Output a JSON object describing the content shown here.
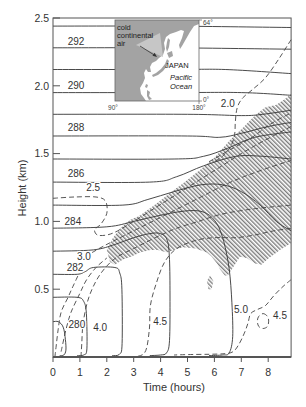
{
  "figure": {
    "xlabel": "Time (hours)",
    "ylabel": "Height (km)"
  },
  "inset": {
    "labels": {
      "cold_air": [
        "cold",
        "continental",
        "air"
      ],
      "country": "JAPAN",
      "ocean": [
        "Pacific",
        "Ocean"
      ]
    },
    "corners": {
      "lon_left": "90°",
      "lon_right": "180°",
      "lat_top": "64°",
      "lat_bottom": "0°"
    },
    "colors": {
      "land": "#a3a3a3",
      "land_light": "#c6c6c6",
      "ocean": "#ffffff"
    }
  },
  "chart_data": {
    "type": "line",
    "title": "",
    "xlabel": "Time (hours)",
    "ylabel": "Height (km)",
    "xlim": [
      0,
      8.85
    ],
    "ylim": [
      0,
      2.5
    ],
    "grid": false,
    "legend": null,
    "xticks": [
      {
        "value": 0,
        "label": "0"
      },
      {
        "value": 1,
        "label": "1"
      },
      {
        "value": 2,
        "label": "2"
      },
      {
        "value": 3,
        "label": "3"
      },
      {
        "value": 4,
        "label": "4"
      },
      {
        "value": 5,
        "label": "5"
      },
      {
        "value": 6,
        "label": "6"
      },
      {
        "value": 7,
        "label": "7"
      },
      {
        "value": 8,
        "label": "8"
      }
    ],
    "yticks": [
      {
        "value": 0.5,
        "label": "0.5"
      },
      {
        "value": 1.0,
        "label": "1.0"
      },
      {
        "value": 1.5,
        "label": "1.5"
      },
      {
        "value": 2.0,
        "label": "2.0"
      },
      {
        "value": 2.5,
        "label": "2.5"
      }
    ],
    "colors": {
      "solid": "#363636",
      "dashed": "#444444",
      "hatch": "#5a5a5a",
      "frame": "#555555"
    },
    "solid_contours": [
      {
        "points": [
          [
            0,
            2.44
          ],
          [
            4.4,
            2.44
          ],
          [
            8.85,
            2.43
          ]
        ]
      },
      {
        "points": [
          [
            0,
            2.28
          ],
          [
            4.4,
            2.28
          ],
          [
            8.85,
            2.27
          ]
        ]
      },
      {
        "points": [
          [
            0,
            2.12
          ],
          [
            4.4,
            2.12
          ],
          [
            6.4,
            2.12
          ],
          [
            8.85,
            2.09
          ]
        ]
      },
      {
        "points": [
          [
            0,
            1.95
          ],
          [
            4.4,
            1.95
          ],
          [
            7.0,
            1.95
          ],
          [
            8.85,
            1.93
          ]
        ]
      },
      {
        "points": [
          [
            0,
            1.79
          ],
          [
            5.0,
            1.79
          ],
          [
            7.0,
            1.78
          ],
          [
            7.8,
            1.79
          ],
          [
            8.85,
            1.82
          ]
        ]
      },
      {
        "points": [
          [
            0,
            1.63
          ],
          [
            5.0,
            1.63
          ],
          [
            6.2,
            1.62
          ],
          [
            7.0,
            1.65
          ],
          [
            8.0,
            1.7
          ],
          [
            8.85,
            1.73
          ]
        ]
      },
      {
        "points": [
          [
            0,
            1.46
          ],
          [
            4.5,
            1.46
          ],
          [
            5.6,
            1.48
          ],
          [
            6.5,
            1.54
          ],
          [
            7.5,
            1.62
          ],
          [
            8.85,
            1.66
          ]
        ]
      },
      {
        "points": [
          [
            0,
            1.29
          ],
          [
            3.6,
            1.29
          ],
          [
            4.6,
            1.33
          ],
          [
            5.6,
            1.41
          ],
          [
            6.8,
            1.48
          ],
          [
            7.8,
            1.48
          ],
          [
            8.85,
            1.46
          ]
        ]
      },
      {
        "points": [
          [
            0,
            1.12
          ],
          [
            2.6,
            1.12
          ],
          [
            3.5,
            1.16
          ],
          [
            4.5,
            1.22
          ],
          [
            5.5,
            1.27
          ],
          [
            6.3,
            1.27
          ],
          [
            7.0,
            1.22
          ],
          [
            7.7,
            1.12
          ],
          [
            8.3,
            1.0
          ],
          [
            8.85,
            0.93
          ]
        ]
      },
      {
        "points": [
          [
            0,
            0.95
          ],
          [
            2.0,
            0.96
          ],
          [
            3.0,
            1.0
          ],
          [
            4.1,
            1.05
          ],
          [
            5.1,
            1.08
          ],
          [
            5.7,
            1.06
          ],
          [
            6.1,
            0.98
          ],
          [
            6.35,
            0.85
          ],
          [
            6.55,
            0.65
          ],
          [
            6.65,
            0.4
          ],
          [
            6.68,
            0.15
          ],
          [
            6.55,
            0.03
          ],
          [
            6.3,
            0.015
          ],
          [
            5.8,
            0.01
          ]
        ]
      },
      {
        "points": [
          [
            0,
            0.78
          ],
          [
            1.5,
            0.79
          ],
          [
            2.3,
            0.83
          ],
          [
            3.0,
            0.88
          ],
          [
            3.6,
            0.91
          ],
          [
            4.0,
            0.91
          ],
          [
            4.25,
            0.86
          ],
          [
            4.33,
            0.72
          ],
          [
            4.35,
            0.45
          ],
          [
            4.33,
            0.12
          ],
          [
            4.22,
            0.03
          ],
          [
            4.0,
            0.015
          ],
          [
            3.6,
            0.01
          ]
        ]
      },
      {
        "points": [
          [
            0,
            0.61
          ],
          [
            0.9,
            0.61
          ],
          [
            1.2,
            0.63
          ],
          [
            1.5,
            0.66
          ],
          [
            2.3,
            0.66
          ],
          [
            2.48,
            0.62
          ],
          [
            2.56,
            0.5
          ],
          [
            2.57,
            0.1
          ],
          [
            2.47,
            0.02
          ],
          [
            2.2,
            0.01
          ]
        ]
      },
      {
        "points": [
          [
            0,
            0.44
          ],
          [
            0.9,
            0.44
          ],
          [
            1.14,
            0.41
          ],
          [
            1.24,
            0.32
          ],
          [
            1.26,
            0.06
          ],
          [
            1.14,
            0.015
          ],
          [
            0.9,
            0.01
          ]
        ]
      },
      {
        "points": [
          [
            0,
            0.26
          ],
          [
            0.2,
            0.26
          ],
          [
            0.38,
            0.22
          ],
          [
            0.46,
            0.13
          ],
          [
            0.48,
            0.05
          ],
          [
            0.4,
            0.015
          ],
          [
            0.25,
            0.01
          ]
        ]
      }
    ],
    "solid_labels": [
      {
        "text": "292",
        "t": 0.86,
        "h": 2.33
      },
      {
        "text": "290",
        "t": 0.86,
        "h": 2.0
      },
      {
        "text": "288",
        "t": 0.86,
        "h": 1.69
      },
      {
        "text": "286",
        "t": 0.86,
        "h": 1.35
      },
      {
        "text": "284",
        "t": 0.74,
        "h": 1.0
      },
      {
        "text": "282",
        "t": 0.82,
        "h": 0.66
      },
      {
        "text": "280",
        "t": 0.89,
        "h": 0.24
      }
    ],
    "dashed_contours": [
      {
        "closed": false,
        "points": [
          [
            8.85,
            2.34
          ],
          [
            8.4,
            2.2
          ],
          [
            7.9,
            2.06
          ],
          [
            7.4,
            1.97
          ],
          [
            7.05,
            1.91
          ],
          [
            6.85,
            1.84
          ],
          [
            6.78,
            1.74
          ],
          [
            6.75,
            1.64
          ],
          [
            6.6,
            1.55
          ],
          [
            6.3,
            1.48
          ],
          [
            6.0,
            1.44
          ]
        ]
      },
      {
        "closed": false,
        "points": [
          [
            0,
            1.17
          ],
          [
            0.8,
            1.18
          ],
          [
            1.6,
            1.18
          ],
          [
            1.95,
            1.15
          ],
          [
            2.0,
            1.06
          ],
          [
            1.78,
            0.98
          ],
          [
            1.55,
            0.94
          ],
          [
            1.65,
            0.9
          ],
          [
            2.0,
            0.9
          ],
          [
            2.4,
            0.93
          ],
          [
            3.0,
            1.0
          ],
          [
            3.8,
            1.1
          ],
          [
            4.6,
            1.2
          ],
          [
            5.4,
            1.3
          ],
          [
            6.2,
            1.4
          ],
          [
            7.0,
            1.5
          ],
          [
            7.8,
            1.59
          ],
          [
            8.85,
            1.7
          ]
        ]
      },
      {
        "closed": false,
        "points": [
          [
            0.07,
            0.0
          ],
          [
            0.11,
            0.07
          ],
          [
            0.19,
            0.2
          ],
          [
            0.3,
            0.33
          ],
          [
            0.56,
            0.44
          ],
          [
            0.74,
            0.52
          ],
          [
            0.93,
            0.6
          ]
        ]
      },
      {
        "closed": false,
        "points": [
          [
            1.45,
            0.77
          ],
          [
            1.9,
            0.82
          ],
          [
            2.6,
            0.89
          ],
          [
            3.5,
            0.98
          ],
          [
            4.5,
            1.08
          ],
          [
            5.5,
            1.18
          ],
          [
            6.5,
            1.28
          ],
          [
            7.5,
            1.36
          ],
          [
            8.85,
            1.45
          ]
        ]
      },
      {
        "closed": false,
        "points": [
          [
            0.3,
            0.04
          ],
          [
            0.48,
            0.2
          ],
          [
            0.67,
            0.33
          ],
          [
            1.0,
            0.47
          ],
          [
            1.25,
            0.57
          ],
          [
            1.6,
            0.66
          ],
          [
            2.0,
            0.73
          ]
        ]
      },
      {
        "closed": false,
        "points": [
          [
            1.04,
            0.0
          ],
          [
            1.07,
            0.1
          ],
          [
            1.12,
            0.25
          ],
          [
            1.3,
            0.42
          ],
          [
            1.6,
            0.56
          ],
          [
            1.95,
            0.66
          ],
          [
            2.4,
            0.74
          ],
          [
            3.0,
            0.8
          ],
          [
            3.8,
            0.88
          ],
          [
            4.6,
            0.95
          ],
          [
            5.4,
            1.0
          ],
          [
            6.2,
            1.05
          ],
          [
            7.0,
            1.08
          ],
          [
            7.8,
            1.1
          ],
          [
            8.85,
            1.12
          ]
        ]
      },
      {
        "closed": false,
        "points": [
          [
            2.86,
            0.0
          ],
          [
            3.4,
            0.03
          ],
          [
            3.58,
            0.2
          ],
          [
            3.62,
            0.38
          ],
          [
            3.85,
            0.55
          ],
          [
            4.15,
            0.7
          ],
          [
            4.6,
            0.8
          ],
          [
            5.3,
            0.86
          ],
          [
            6.0,
            0.88
          ],
          [
            6.8,
            0.88
          ],
          [
            7.5,
            0.9
          ],
          [
            8.2,
            0.93
          ],
          [
            8.85,
            0.95
          ]
        ]
      },
      {
        "closed": false,
        "points": [
          [
            8.85,
            0.57
          ],
          [
            8.55,
            0.52
          ],
          [
            8.2,
            0.45
          ],
          [
            7.9,
            0.38
          ],
          [
            7.6,
            0.35
          ],
          [
            7.35,
            0.32
          ],
          [
            7.25,
            0.25
          ],
          [
            7.1,
            0.17
          ],
          [
            6.9,
            0.09
          ],
          [
            6.7,
            0.04
          ],
          [
            6.4,
            0.025
          ],
          [
            5.8,
            0.02
          ],
          [
            5.0,
            0.018
          ],
          [
            4.5,
            0.015
          ]
        ]
      },
      {
        "closed": true,
        "points": [
          [
            7.81,
            0.32
          ],
          [
            7.97,
            0.3
          ],
          [
            8.02,
            0.265
          ],
          [
            7.97,
            0.225
          ],
          [
            7.81,
            0.21
          ],
          [
            7.65,
            0.225
          ],
          [
            7.6,
            0.265
          ],
          [
            7.65,
            0.3
          ]
        ]
      },
      {
        "closed": false,
        "points": [
          [
            5.8,
            1.44
          ],
          [
            6.6,
            1.53
          ],
          [
            7.4,
            1.62
          ],
          [
            8.1,
            1.72
          ],
          [
            8.85,
            1.8
          ]
        ]
      }
    ],
    "dashed_labels": [
      {
        "text": "2.0",
        "t": 6.5,
        "h": 1.87
      },
      {
        "text": "2.5",
        "t": 1.49,
        "h": 1.25
      },
      {
        "text": "3.0",
        "t": 1.15,
        "h": 0.74
      },
      {
        "text": "4.0",
        "t": 1.75,
        "h": 0.22
      },
      {
        "text": "4.5",
        "t": 3.98,
        "h": 0.26
      },
      {
        "text": "5.0",
        "t": 6.99,
        "h": 0.35
      },
      {
        "text": "4.5",
        "t": 8.44,
        "h": 0.31
      }
    ],
    "hatched_regions": [
      {
        "points": [
          [
            2.12,
            0.7
          ],
          [
            2.0,
            0.79
          ],
          [
            2.23,
            0.88
          ],
          [
            2.5,
            0.95
          ],
          [
            2.86,
            1.01
          ],
          [
            3.2,
            1.04
          ],
          [
            3.49,
            1.08
          ],
          [
            3.9,
            1.14
          ],
          [
            4.35,
            1.21
          ],
          [
            4.9,
            1.29
          ],
          [
            5.46,
            1.38
          ],
          [
            6.0,
            1.47
          ],
          [
            6.58,
            1.6
          ],
          [
            7.0,
            1.68
          ],
          [
            7.51,
            1.78
          ],
          [
            7.88,
            1.84
          ],
          [
            8.3,
            1.86
          ],
          [
            8.6,
            1.9
          ],
          [
            8.85,
            1.94
          ],
          [
            8.85,
            0.84
          ],
          [
            8.44,
            0.79
          ],
          [
            7.96,
            0.72
          ],
          [
            7.75,
            0.68
          ],
          [
            7.51,
            0.69
          ],
          [
            7.2,
            0.73
          ],
          [
            6.95,
            0.74
          ],
          [
            6.69,
            0.66
          ],
          [
            6.5,
            0.6
          ],
          [
            6.39,
            0.6
          ],
          [
            6.2,
            0.65
          ],
          [
            6.1,
            0.69
          ],
          [
            5.9,
            0.74
          ],
          [
            5.72,
            0.77
          ],
          [
            5.3,
            0.8
          ],
          [
            4.83,
            0.81
          ],
          [
            4.5,
            0.79
          ],
          [
            4.24,
            0.77
          ],
          [
            3.9,
            0.79
          ],
          [
            3.61,
            0.79
          ],
          [
            3.23,
            0.77
          ],
          [
            2.9,
            0.74
          ],
          [
            2.6,
            0.72
          ],
          [
            2.3,
            0.68
          ]
        ]
      },
      {
        "points": [
          [
            5.72,
            0.56
          ],
          [
            5.84,
            0.6
          ],
          [
            5.96,
            0.56
          ],
          [
            5.9,
            0.5
          ],
          [
            5.78,
            0.5
          ]
        ]
      }
    ]
  }
}
